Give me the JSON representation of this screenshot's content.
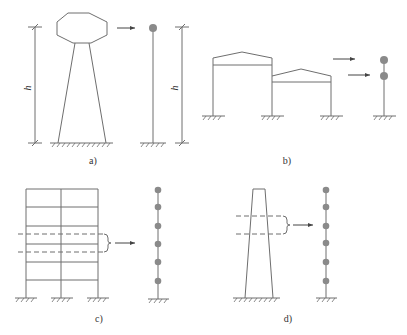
{
  "panels": [
    {
      "id": "a",
      "label": "a)",
      "description": "Water tower on tapered shaft simplified to single-mass cantilever",
      "dimension_label": "h"
    },
    {
      "id": "b",
      "label": "b)",
      "description": "Two-span single-story frames with gable roofs simplified to two-mass stick model"
    },
    {
      "id": "c",
      "label": "c)",
      "description": "Six-story two-bay frame simplified to six-mass stick model"
    },
    {
      "id": "d",
      "label": "d)",
      "description": "Tapered chimney/tower simplified to six-mass stick model"
    }
  ],
  "labels": {
    "a": "a)",
    "b": "b)",
    "c": "c)",
    "d": "d)",
    "h_left": "h",
    "h_right": "h"
  },
  "colors": {
    "line": "#6e6e6e",
    "mass": "#8a8a8a",
    "background": "#ffffff"
  }
}
